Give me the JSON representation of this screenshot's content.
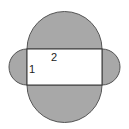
{
  "diagram": {
    "labels": {
      "width": "2",
      "height": "1"
    },
    "colors": {
      "shaded": "#a8a8a8",
      "stroke": "#555555",
      "rectangle_fill": "#ffffff"
    }
  }
}
